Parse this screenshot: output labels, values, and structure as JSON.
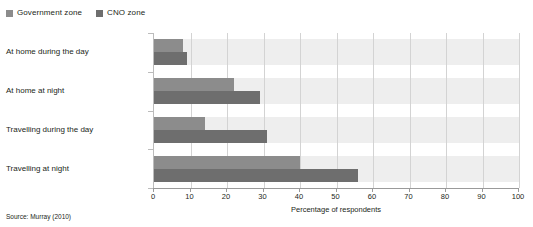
{
  "legend": {
    "position": "top-left",
    "entries": [
      {
        "label": "Government zone",
        "color": "#8c8c8c",
        "icon": "legend-swatch"
      },
      {
        "label": "CNO zone",
        "color": "#6e6e6e",
        "icon": "legend-swatch"
      }
    ]
  },
  "source_note": "Source: Murray (2010)",
  "chart_data": {
    "type": "bar",
    "orientation": "horizontal",
    "title": "",
    "subtitle": "",
    "xlabel": "Percentage of respondents",
    "ylabel": "",
    "xlim": [
      0,
      100
    ],
    "ylim": null,
    "xticks": [
      0,
      10,
      20,
      30,
      40,
      50,
      60,
      70,
      80,
      90,
      100
    ],
    "xtick_labels": [
      "0",
      "10",
      "20",
      "30",
      "40",
      "50",
      "60",
      "70",
      "80",
      "90",
      "100"
    ],
    "grid": "vertical",
    "legend_position": "top-left",
    "categories": [
      "At home during the day",
      "At home at night",
      "Travelling during the day",
      "Travelling at night"
    ],
    "series": [
      {
        "name": "Government zone",
        "color": "#8c8c8c",
        "values": [
          8,
          22,
          14,
          40
        ]
      },
      {
        "name": "CNO zone",
        "color": "#6e6e6e",
        "values": [
          9,
          29,
          31,
          56
        ]
      }
    ],
    "annotations": []
  }
}
